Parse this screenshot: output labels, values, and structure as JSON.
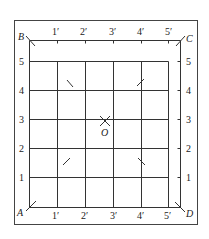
{
  "diagram": {
    "type": "grid-square-with-labels",
    "corners": {
      "A": "A",
      "B": "B",
      "C": "C",
      "D": "D"
    },
    "center_label": "O",
    "row_labels": [
      "1",
      "2",
      "3",
      "4",
      "5"
    ],
    "column_labels": [
      "1′",
      "2′",
      "3′",
      "4′",
      "5′"
    ],
    "colors": {
      "line": "#333333",
      "text": "#222222",
      "background": "#ffffff"
    }
  }
}
